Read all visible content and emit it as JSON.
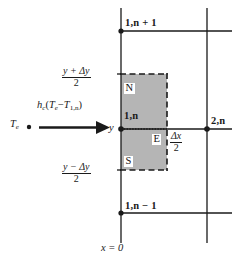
{
  "figure": {
    "background_color": "#ffffff",
    "line_color": "#1a1a1a",
    "shade_color": "#b5b5b5",
    "width": 242,
    "height": 261
  },
  "nodes": {
    "top": "1,n + 1",
    "center": "1,n",
    "bottom": "1,n − 1",
    "right": "2,n"
  },
  "control_volume": {
    "north_label": "N",
    "south_label": "S",
    "east_label": "E",
    "top_axis_label_num": "y + Δy",
    "top_axis_label_den": "2",
    "bottom_axis_label_num": "y − Δy",
    "bottom_axis_label_den": "2",
    "east_dim_num": "Δx",
    "east_dim_den": "2"
  },
  "axes": {
    "y_tick": "y",
    "x_origin": "x = 0"
  },
  "convection": {
    "fluid_temp": "T",
    "fluid_temp_sub": "e",
    "flux_h": "h",
    "flux_h_sub": "c",
    "flux_open": "(",
    "flux_te": "T",
    "flux_te_sub": "e",
    "flux_minus": "−",
    "flux_t1n": "T",
    "flux_t1n_sub": "1,n",
    "flux_close": ")",
    "arrow_name": "convection-arrow"
  }
}
